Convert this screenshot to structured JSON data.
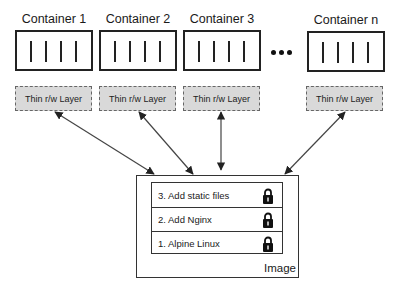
{
  "containers": [
    {
      "label": "Container 1",
      "layer_label": "Thin r/w Layer"
    },
    {
      "label": "Container 2",
      "layer_label": "Thin r/w Layer"
    },
    {
      "label": "Container 3",
      "layer_label": "Thin r/w Layer"
    },
    {
      "label": "Container n",
      "layer_label": "Thin r/w Layer"
    }
  ],
  "ellipsis": "•••",
  "image": {
    "label": "Image",
    "layers": [
      {
        "label": "3. Add static files",
        "icon": "lock-icon"
      },
      {
        "label": "2. Add Nginx",
        "icon": "lock-icon"
      },
      {
        "label": "1. Alpine Linux",
        "icon": "lock-icon"
      }
    ]
  },
  "colors": {
    "thin_layer_fill": "#d9d9d9",
    "thin_layer_border": "#666666",
    "line": "#333333"
  }
}
